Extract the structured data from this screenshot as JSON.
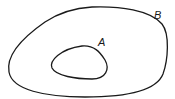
{
  "diagram": {
    "type": "venn-subset",
    "sets": [
      {
        "label": "B",
        "role": "outer"
      },
      {
        "label": "A",
        "role": "inner"
      }
    ],
    "stroke_color": "#1a1a1a",
    "background": "#ffffff"
  }
}
